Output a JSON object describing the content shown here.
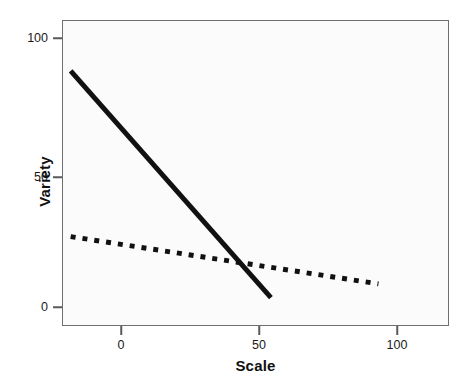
{
  "chart_data": {
    "type": "line",
    "title": "",
    "xlabel": "Scale",
    "ylabel": "Variety",
    "xlim": [
      -18,
      122
    ],
    "ylim": [
      -8,
      114
    ],
    "xticks": [
      0,
      50,
      100
    ],
    "xtick_labels": [
      "0",
      "50",
      "100"
    ],
    "yticks": [
      0,
      50,
      100
    ],
    "ytick_labels": [
      "0",
      "50",
      "100"
    ],
    "grid": false,
    "legend": "none",
    "panel_background": "#fbfbfb",
    "panel_border_color": "#6e6e6e",
    "line_color": "#111111",
    "series": [
      {
        "name": "steep-solid-line",
        "style": "solid",
        "x": [
          -15.2,
          57.6
        ],
        "y": [
          94.0,
          3.0
        ]
      },
      {
        "name": "shallow-dotted-line",
        "style": "dotted",
        "x": [
          -15.2,
          96.7
        ],
        "y": [
          27.5,
          8.5
        ]
      }
    ]
  }
}
